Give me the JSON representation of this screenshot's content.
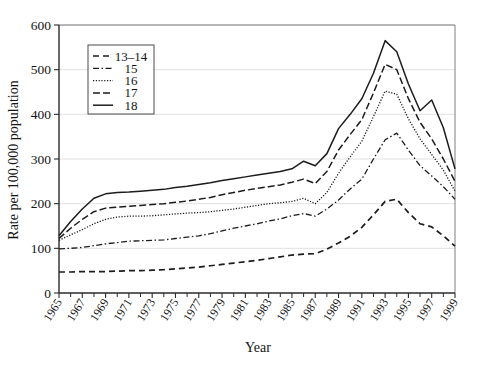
{
  "chart_data": {
    "type": "line",
    "title": "",
    "xlabel": "Year",
    "ylabel": "Rate per 100,000 population",
    "xlim": [
      1965,
      1999
    ],
    "ylim": [
      0,
      600
    ],
    "ytick_values": [
      0,
      100,
      200,
      300,
      400,
      500,
      600
    ],
    "ytick_labels": [
      "0",
      "100",
      "200",
      "300",
      "400",
      "500",
      "600"
    ],
    "xtick_labels": [
      "1965",
      "1967",
      "1969",
      "1971",
      "1973",
      "1975",
      "1977",
      "1979",
      "1981",
      "1983",
      "1985",
      "1987",
      "1989",
      "1991",
      "1993",
      "1995",
      "1997",
      "1999"
    ],
    "xtick_values": [
      1965,
      1967,
      1969,
      1971,
      1973,
      1975,
      1977,
      1979,
      1981,
      1983,
      1985,
      1987,
      1989,
      1991,
      1993,
      1995,
      1997,
      1999
    ],
    "x": [
      1965,
      1966,
      1967,
      1968,
      1969,
      1970,
      1971,
      1972,
      1973,
      1974,
      1975,
      1976,
      1977,
      1978,
      1979,
      1980,
      1981,
      1982,
      1983,
      1984,
      1985,
      1986,
      1987,
      1988,
      1989,
      1990,
      1991,
      1992,
      1993,
      1994,
      1995,
      1996,
      1997,
      1998,
      1999
    ],
    "grid": true,
    "legend_position": "upper-left",
    "legend_title": "",
    "series": [
      {
        "name": "13–14",
        "dash": "dashed",
        "values": [
          47,
          47,
          48,
          48,
          48,
          49,
          50,
          50,
          51,
          52,
          54,
          56,
          58,
          61,
          64,
          67,
          70,
          73,
          77,
          81,
          85,
          87,
          88,
          98,
          112,
          127,
          147,
          175,
          205,
          210,
          180,
          155,
          148,
          128,
          105
        ]
      },
      {
        "name": "15",
        "dash": "dashdot",
        "values": [
          99,
          100,
          102,
          106,
          110,
          113,
          116,
          117,
          118,
          119,
          122,
          125,
          128,
          133,
          139,
          145,
          150,
          155,
          161,
          166,
          173,
          178,
          172,
          188,
          208,
          233,
          255,
          300,
          343,
          358,
          320,
          285,
          262,
          238,
          210
        ]
      },
      {
        "name": "16",
        "dash": "dotted",
        "values": [
          118,
          130,
          142,
          155,
          165,
          170,
          172,
          172,
          173,
          175,
          177,
          179,
          180,
          182,
          185,
          188,
          192,
          196,
          200,
          202,
          205,
          212,
          200,
          225,
          268,
          305,
          340,
          395,
          452,
          445,
          390,
          345,
          310,
          275,
          228
        ]
      },
      {
        "name": "17",
        "dash": "longdash",
        "values": [
          122,
          145,
          165,
          182,
          190,
          192,
          194,
          196,
          198,
          200,
          203,
          206,
          210,
          214,
          220,
          225,
          230,
          234,
          238,
          242,
          248,
          255,
          245,
          272,
          320,
          355,
          388,
          448,
          512,
          500,
          435,
          382,
          345,
          300,
          250
        ]
      },
      {
        "name": "18",
        "dash": "solid",
        "values": [
          128,
          160,
          188,
          212,
          222,
          225,
          226,
          228,
          230,
          232,
          236,
          239,
          243,
          247,
          252,
          256,
          260,
          264,
          268,
          272,
          278,
          295,
          285,
          312,
          368,
          400,
          435,
          492,
          565,
          540,
          468,
          408,
          432,
          370,
          278
        ]
      }
    ]
  },
  "legend": {
    "entries": [
      {
        "label": "13–14"
      },
      {
        "label": "15"
      },
      {
        "label": "16"
      },
      {
        "label": "17"
      },
      {
        "label": "18"
      }
    ]
  }
}
